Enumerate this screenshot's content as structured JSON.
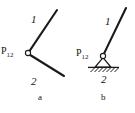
{
  "figure": {
    "background_color": "#ffffff",
    "ink_color": "#1a1a1a",
    "width": 135,
    "height": 113,
    "panels": [
      {
        "id": "a",
        "caption": "a",
        "joint_label": "P",
        "joint_subscript": "12",
        "joint_type": "pin-joint-free",
        "joint_center": [
          28,
          53
        ],
        "joint_radius": 2.6,
        "links": [
          {
            "name": "1",
            "label": "1",
            "from": [
              28,
              53
            ],
            "to": [
              57,
              10
            ]
          },
          {
            "name": "2",
            "label": "2",
            "from": [
              28,
              53
            ],
            "to": [
              64,
              76
            ]
          }
        ]
      },
      {
        "id": "b",
        "caption": "b",
        "joint_label": "P",
        "joint_subscript": "12",
        "joint_type": "pin-support-grounded",
        "joint_center": [
          103,
          56
        ],
        "joint_radius": 2.6,
        "ground": {
          "line_y": 67,
          "line_x1": 88,
          "line_x2": 119,
          "hatch_count": 7,
          "triangle": [
            [
              103,
              58
            ],
            [
              95,
              67
            ],
            [
              111,
              67
            ]
          ]
        },
        "links": [
          {
            "name": "1",
            "label": "1",
            "from": [
              103,
              56
            ],
            "to": [
              126,
              8
            ]
          },
          {
            "name": "2",
            "label": "2",
            "from": [
              95,
              67
            ],
            "to": [
              111,
              67
            ]
          }
        ]
      }
    ]
  }
}
